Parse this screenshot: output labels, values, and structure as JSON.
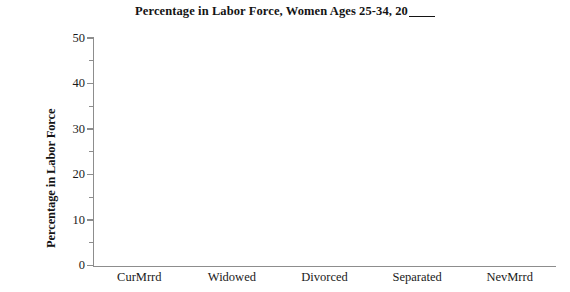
{
  "chart_data": {
    "type": "bar",
    "title_prefix": "Percentage in Labor Force, Women Ages 25-34, 20",
    "title_blank": "____",
    "xlabel": "",
    "ylabel": "Percentage in Labor Force",
    "categories": [
      "CurMrrd",
      "Widowed",
      "Divorced",
      "Separated",
      "NevMrrd"
    ],
    "values": [
      null,
      null,
      null,
      null,
      null
    ],
    "series": [
      {
        "name": "Percentage in Labor Force",
        "values": [
          null,
          null,
          null,
          null,
          null
        ]
      }
    ],
    "ylim": [
      0,
      50
    ],
    "y_ticks": [
      0,
      10,
      20,
      30,
      40,
      50
    ],
    "y_tick_labels": [
      "0",
      "10",
      "20",
      "30",
      "40",
      "50"
    ],
    "y_minor_ticks": [
      5,
      15,
      25,
      35,
      45
    ],
    "grid": false,
    "legend": "none",
    "note": "blank worksheet template - plot area contains no plotted bars"
  },
  "axes": {
    "y_axis_title": "Percentage in Labor Force",
    "y_tick_labels": [
      "50",
      "40",
      "30",
      "20",
      "10",
      "0"
    ],
    "x_tick_labels": [
      "CurMrrd",
      "Widowed",
      "Divorced",
      "Separated",
      "NevMrrd"
    ]
  },
  "style": {
    "axis_color": "#8d8d8d",
    "text_color": "#1a1a1a",
    "background": "#ffffff"
  }
}
